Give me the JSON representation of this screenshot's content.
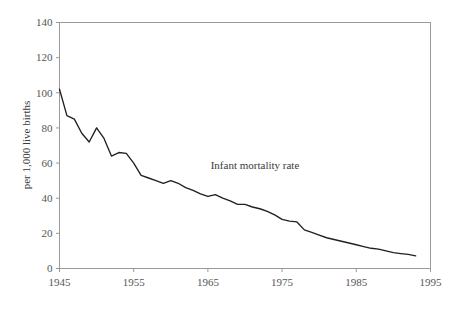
{
  "chart_data": {
    "type": "line",
    "title": "",
    "subtitle": "",
    "xlabel": "",
    "ylabel": "per 1,000 live births",
    "annotation": "Infant mortality rate",
    "grid": false,
    "legend_position": "inline-annotation",
    "xlim": [
      1945,
      1995
    ],
    "ylim": [
      0,
      140
    ],
    "xticks": [
      1945,
      1955,
      1965,
      1975,
      1985,
      1995
    ],
    "xtick_labels": [
      "1945",
      "1955",
      "1965",
      "1975",
      "1985",
      "1995"
    ],
    "yticks": [
      0,
      20,
      40,
      60,
      80,
      100,
      120,
      140
    ],
    "ytick_labels": [
      "0",
      "20",
      "40",
      "60",
      "80",
      "100",
      "120",
      "140"
    ],
    "series": [
      {
        "name": "Infant mortality rate",
        "color": "#231f20",
        "x": [
          1945,
          1946,
          1947,
          1948,
          1949,
          1950,
          1951,
          1952,
          1953,
          1954,
          1955,
          1956,
          1957,
          1958,
          1959,
          1960,
          1961,
          1962,
          1963,
          1964,
          1965,
          1966,
          1967,
          1968,
          1969,
          1970,
          1971,
          1972,
          1973,
          1974,
          1975,
          1976,
          1977,
          1978,
          1979,
          1980,
          1981,
          1982,
          1983,
          1984,
          1985,
          1986,
          1987,
          1988,
          1989,
          1990,
          1991,
          1992,
          1993
        ],
        "values": [
          102.0,
          87.0,
          85.0,
          77.0,
          72.0,
          80.0,
          74.0,
          64.0,
          66.0,
          65.5,
          60.0,
          53.0,
          51.5,
          50.0,
          48.5,
          50.0,
          48.5,
          46.0,
          44.5,
          42.5,
          41.0,
          42.0,
          40.0,
          38.5,
          36.5,
          36.5,
          35.0,
          34.0,
          32.5,
          30.5,
          28.0,
          27.0,
          26.5,
          22.0,
          20.5,
          19.0,
          17.5,
          16.5,
          15.5,
          14.5,
          13.5,
          12.5,
          11.5,
          11.0,
          10.0,
          9.0,
          8.5,
          8.0,
          7.2
        ]
      }
    ]
  },
  "yaxis": {
    "title": "per 1,000 live births"
  },
  "annotations": {
    "series_label": "Infant mortality rate"
  }
}
